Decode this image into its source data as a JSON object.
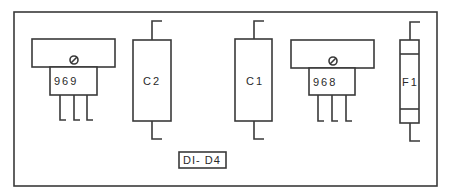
{
  "diagram": {
    "type": "pcb-component-layout",
    "stroke_color": "#3a3a3a",
    "background": "#ffffff",
    "components": [
      {
        "id": "969",
        "kind": "transistor",
        "label": "969"
      },
      {
        "id": "C2",
        "kind": "capacitor",
        "label": "C2"
      },
      {
        "id": "C1",
        "kind": "capacitor",
        "label": "C1"
      },
      {
        "id": "968",
        "kind": "transistor",
        "label": "968"
      },
      {
        "id": "F1",
        "kind": "fuse",
        "label": "F1"
      }
    ],
    "diode_group": {
      "label": "DI- D4"
    }
  }
}
